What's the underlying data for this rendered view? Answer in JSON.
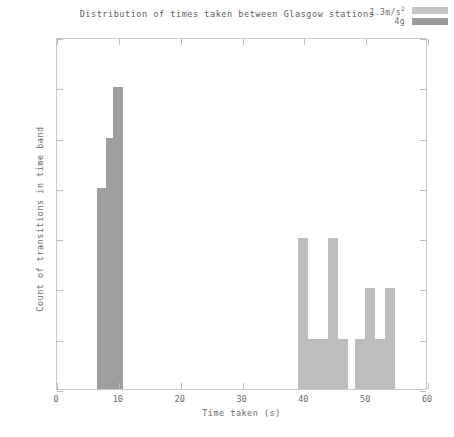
{
  "chart_data": {
    "type": "bar",
    "title": "Distribution of times taken between Glasgow stations",
    "xlabel": "Time taken (s)",
    "ylabel": "Count of transitions in time band",
    "xlim": [
      0,
      60
    ],
    "ylim": [
      0,
      7
    ],
    "xticks": [
      0,
      10,
      20,
      30,
      40,
      50,
      60
    ],
    "yticks": [
      0,
      1,
      2,
      3,
      4,
      5,
      6,
      7
    ],
    "grid": false,
    "legend_position": "top-right",
    "bin_width": 1.6,
    "series": [
      {
        "name": "1.3m/s²",
        "color": "#bdbdbd",
        "bars": [
          {
            "x": 39.0,
            "value": 3
          },
          {
            "x": 40.6,
            "value": 1
          },
          {
            "x": 42.2,
            "value": 1
          },
          {
            "x": 43.8,
            "value": 3
          },
          {
            "x": 45.4,
            "value": 1
          },
          {
            "x": 48.2,
            "value": 1
          },
          {
            "x": 49.8,
            "value": 2
          },
          {
            "x": 51.4,
            "value": 1
          },
          {
            "x": 53.0,
            "value": 2
          }
        ]
      },
      {
        "name": "4g",
        "color": "#9e9e9e",
        "bars": [
          {
            "x": 6.4,
            "value": 4
          },
          {
            "x": 8.0,
            "value": 5
          },
          {
            "x": 9.0,
            "value": 6
          }
        ]
      }
    ]
  },
  "legend": {
    "entries": [
      {
        "label_main": "1.3m/s",
        "label_sup": "2",
        "swatch_color": "#c4c4c4"
      },
      {
        "label_main": "4g",
        "label_sup": "",
        "swatch_color": "#9a9a9a"
      }
    ]
  }
}
